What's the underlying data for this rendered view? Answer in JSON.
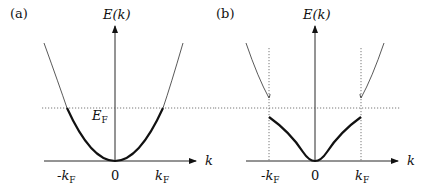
{
  "panels": [
    {
      "label": "(a)",
      "axis_y_label": "E(k)",
      "axis_x_label": "k",
      "fermi_level_label": "E",
      "fermi_level_sub": "F",
      "ticks": [
        {
          "main": "-k",
          "sub": "F"
        },
        {
          "main": "0",
          "sub": ""
        },
        {
          "main": "k",
          "sub": "F"
        }
      ],
      "description": "Free-electron parabolic dispersion; occupied states below E_F drawn thick"
    },
    {
      "label": "(b)",
      "axis_y_label": "E(k)",
      "axis_x_label": "k",
      "ticks": [
        {
          "main": "-k",
          "sub": "F"
        },
        {
          "main": "0",
          "sub": ""
        },
        {
          "main": "k",
          "sub": "F"
        }
      ],
      "description": "Dispersion with band gap opened at ±k_F; lower band occupied (thick), upper band empty (thin)"
    }
  ],
  "colors": {
    "line": "#111111",
    "dotted": "#555555",
    "background": "#ffffff"
  }
}
